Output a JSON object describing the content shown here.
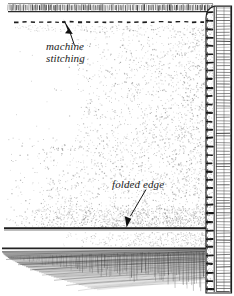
{
  "figure": {
    "width": 234,
    "height": 296,
    "background_color": "#ffffff",
    "ink_color": "#1a1a1a"
  },
  "labels": {
    "machine_stitching": {
      "line1": "machine",
      "line2": "stitching",
      "style": "italic-serif",
      "x": 46,
      "y": 40
    },
    "folded_edge": {
      "text": "folded edge",
      "style": "italic-serif",
      "x": 112,
      "y": 178
    }
  },
  "leaders": {
    "machine_stitching_arrow": {
      "from_x": 74,
      "from_y": 46,
      "to_x": 66,
      "to_y": 22,
      "arrowhead": "solid-triangle",
      "direction": "up-left"
    },
    "folded_edge_arrow": {
      "from_x": 146,
      "from_y": 190,
      "to_x": 127,
      "to_y": 227,
      "arrowhead": "solid-triangle",
      "direction": "down-left"
    }
  },
  "features": {
    "raw_edge_band": {
      "name": "cut-edge-tick-band",
      "y_top": 4,
      "y_bottom": 11,
      "x_start": 8,
      "x_end": 213,
      "tick_count": 118
    },
    "stitch_line": {
      "name": "machine-stitch-dashes",
      "y": 22,
      "x_start": 14,
      "x_end": 212,
      "dash_length": 4,
      "dash_gap": 4
    },
    "folded_edge_line": {
      "name": "folded-edge-rule",
      "y": 228,
      "x_start": 4,
      "x_end": 213,
      "thickness": 2
    },
    "selvage_band": {
      "name": "right-edge-band",
      "x_left": 205,
      "x_right": 232,
      "y_top": 6,
      "y_bottom": 292,
      "corner": "rounded-top"
    },
    "weave_texture": {
      "name": "woven-fabric-crosshatch",
      "y_top": 240,
      "y_bottom": 290,
      "fade_direction": "toward-lower-left"
    },
    "stipple_field": {
      "name": "fabric-shading-stipple",
      "density": "increases toward right and bottom-right",
      "region": "between stitch line and folded edge"
    }
  }
}
